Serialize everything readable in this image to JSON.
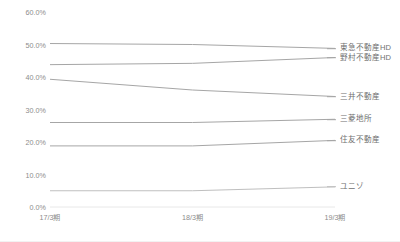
{
  "chart_data": {
    "type": "line",
    "title": "",
    "subtitle": "",
    "xlabel": "",
    "ylabel": "",
    "x": [
      "17/3期",
      "18/3期",
      "19/3期"
    ],
    "categories": [
      "17/3期",
      "18/3期",
      "19/3期"
    ],
    "ylim": [
      0,
      60
    ],
    "yticks": [
      0,
      10,
      20,
      30,
      40,
      50,
      60
    ],
    "ytick_labels": [
      "0.0%",
      "10.0%",
      "20.0%",
      "30.0%",
      "40.0%",
      "50.0%",
      "60.0%"
    ],
    "grid": false,
    "legend_position": "right",
    "markers": false,
    "series": [
      {
        "name": "東急不動産HD",
        "values": [
          50.3,
          50.0,
          48.8
        ],
        "color": "#a6a6a6"
      },
      {
        "name": "野村不動産HD",
        "values": [
          43.8,
          44.2,
          46.0
        ],
        "color": "#a6a6a6"
      },
      {
        "name": "三井不動産",
        "values": [
          39.3,
          36.0,
          34.0
        ],
        "color": "#a6a6a6"
      },
      {
        "name": "三菱地所",
        "values": [
          26.0,
          26.0,
          27.0
        ],
        "color": "#a6a6a6"
      },
      {
        "name": "住友不動産",
        "values": [
          18.8,
          18.8,
          20.5
        ],
        "color": "#a6a6a6"
      },
      {
        "name": "ユニゾ",
        "values": [
          5.0,
          5.0,
          6.2
        ],
        "color": "#bfbfbf"
      }
    ]
  },
  "axis": {
    "baseline_color": "#e8e8e8",
    "tick_label_color": "#8c8c8c"
  }
}
